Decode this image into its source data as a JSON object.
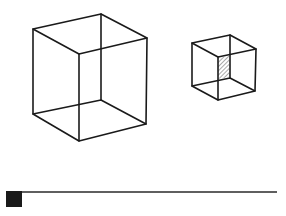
{
  "figure": {
    "colors": {
      "stroke": "#1a1a1a",
      "background": "#ffffff",
      "hatch": "#555555",
      "bar_block": "#1a1a1a"
    },
    "large_cube": {
      "vertices": {
        "A": [
          33,
          29
        ],
        "B": [
          101,
          14
        ],
        "C": [
          147,
          38
        ],
        "D": [
          79,
          54
        ],
        "E": [
          33,
          114
        ],
        "F": [
          79,
          141
        ],
        "G": [
          146,
          124
        ],
        "H": [
          101,
          100
        ]
      }
    },
    "small_cube": {
      "vertices": {
        "a": [
          192,
          43
        ],
        "b": [
          230,
          35
        ],
        "c": [
          256,
          49
        ],
        "d": [
          218,
          57
        ],
        "e": [
          192,
          86
        ],
        "f": [
          218,
          100
        ],
        "g": [
          255,
          91
        ],
        "h": [
          230,
          78
        ]
      },
      "hatched_region": [
        [
          218,
          58
        ],
        [
          229,
          56
        ],
        [
          229,
          77
        ],
        [
          218,
          79
        ]
      ]
    },
    "bottom_bar": {
      "block": {
        "x": 6,
        "y": 191,
        "width": 16,
        "height": 16
      },
      "line": {
        "x1": 22,
        "y1": 192,
        "x2": 277,
        "y2": 192
      }
    }
  }
}
